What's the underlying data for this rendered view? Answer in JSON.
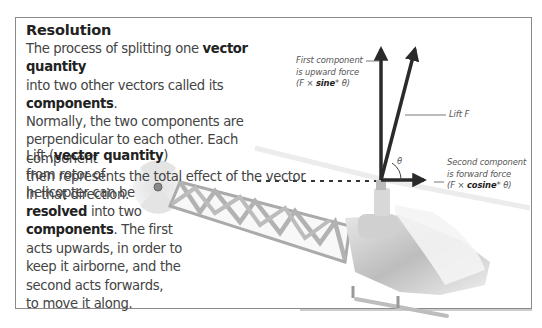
{
  "title": "Resolution",
  "intro": {
    "parts": [
      {
        "text": "The process of splitting one ",
        "bold": false
      },
      {
        "text": "vector quantity",
        "bold": true
      },
      {
        "text": " into two other vectors called its ",
        "bold": false
      },
      {
        "text": "components",
        "bold": true
      },
      {
        "text": ". Normally, the two components are perpendicular to each other. Each component then represents the total effect of the vector in that direction.",
        "bold": false
      }
    ],
    "t0": "The process of splitting one ",
    "b0": "vector quantity",
    "t1": "into two other vectors called its ",
    "b1": "components",
    "t2": ".",
    "t3": "Normally, the two components are",
    "t4": "perpendicular to each other. Each component",
    "t5": "then represents the total effect of the vector",
    "t6": "in that direction."
  },
  "body": {
    "l0a": "Lift (",
    "l0b": "vector quantity",
    "l0c": ")",
    "l1": "from rotor of",
    "l2": "helicopter can be",
    "l3b": "resolved",
    "l3": " into two",
    "l4b": "components",
    "l4": ". The first",
    "l5": "acts upwards, in order to",
    "l6": "keep it airborne, and the",
    "l7": "second acts forwards,",
    "l8": "to move it along."
  },
  "labels": {
    "first": {
      "line1": "First component",
      "line2": "is upward force",
      "line3a": "(F × ",
      "line3b": "sine",
      "line3c": "* θ)"
    },
    "lift": "Lift F",
    "second": {
      "line1": "Second component",
      "line2": "is forward force",
      "line3a": "(F × ",
      "line3b": "cosine",
      "line3c": "* θ)"
    },
    "theta": "θ"
  },
  "diagram": {
    "vectors": [
      {
        "name": "lift",
        "from": [
          381,
          180
        ],
        "to": [
          416,
          45
        ]
      },
      {
        "name": "upward-component",
        "from": [
          381,
          180
        ],
        "to": [
          381,
          45
        ]
      },
      {
        "name": "forward-component",
        "from": [
          381,
          180
        ],
        "to": [
          428,
          180
        ]
      }
    ],
    "colors": {
      "arrow": "#2a2a2a",
      "frame": "#8a8a8a",
      "text": "#444444",
      "helicopter": "#c8c8c8"
    }
  }
}
